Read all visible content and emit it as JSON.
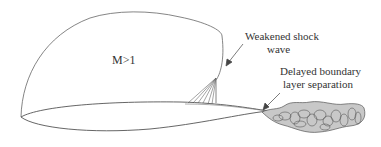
{
  "diagram": {
    "labels": {
      "mach_region": "M>1",
      "shock_line1": "Weakened shock",
      "shock_line2": "wave",
      "separation_line1": "Delayed boundary",
      "separation_line2": "layer separation"
    },
    "colors": {
      "line": "#555555",
      "wake_fill": "#c8c8c8",
      "text": "#333333"
    }
  }
}
